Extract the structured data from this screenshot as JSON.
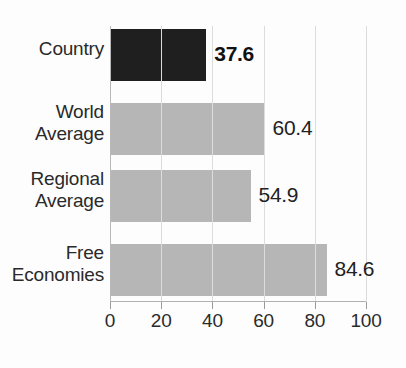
{
  "chart_data": {
    "type": "bar",
    "orientation": "horizontal",
    "title": "",
    "title_visible": false,
    "title_note": "cropped off top edge of image",
    "xlabel": "",
    "ylabel": "",
    "categories": [
      "Country",
      "World Average",
      "Regional Average",
      "Free Economies"
    ],
    "values": [
      37.6,
      60.4,
      54.9,
      84.6
    ],
    "value_labels": [
      "37.6",
      "60.4",
      "54.9",
      "84.6"
    ],
    "xlim": [
      0,
      100
    ],
    "xticks": [
      0,
      20,
      40,
      60,
      80,
      100
    ],
    "xtick_labels": [
      "0",
      "20",
      "40",
      "60",
      "80",
      "100"
    ],
    "grid": true,
    "grid_axis": "x",
    "legend": false,
    "bar_colors": [
      "#1f1f1f",
      "#b6b6b6",
      "#b6b6b6",
      "#b6b6b6"
    ],
    "highlighted_category": "Country",
    "emphasis": {
      "bold_value_labels": [
        "37.6"
      ]
    }
  },
  "axis": {
    "ticks": [
      {
        "value": 0,
        "label": "0"
      },
      {
        "value": 20,
        "label": "20"
      },
      {
        "value": 40,
        "label": "40"
      },
      {
        "value": 60,
        "label": "60"
      },
      {
        "value": 80,
        "label": "80"
      },
      {
        "value": 100,
        "label": "100"
      }
    ]
  },
  "rows": [
    {
      "line1": "Country",
      "line2": "",
      "value": "37.6"
    },
    {
      "line1": "World",
      "line2": "Average",
      "value": "60.4"
    },
    {
      "line1": "Regional",
      "line2": "Average",
      "value": "54.9"
    },
    {
      "line1": "Free",
      "line2": "Economies",
      "value": "84.6"
    }
  ],
  "colors": {
    "bar_dark": "#1f1f1f",
    "bar_light": "#b6b6b6",
    "gridline": "#dcdcdc",
    "text": "#2a2a2a",
    "background": "#fdfdfd"
  }
}
